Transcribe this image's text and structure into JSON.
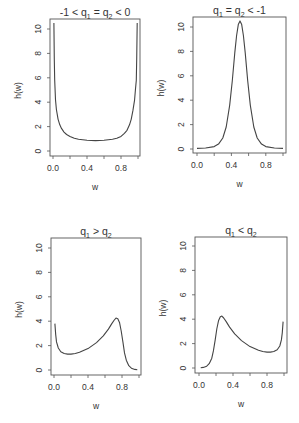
{
  "figure": {
    "line_color": "#444444",
    "axis_color": "#555555"
  },
  "chart_data": [
    {
      "type": "line",
      "title": "-1 < q1 = q2 < 0",
      "title_parts": [
        [
          "-1 < q",
          ""
        ],
        [
          "1",
          "sub"
        ],
        [
          " = q",
          ""
        ],
        [
          "2",
          "sub"
        ],
        [
          " < 0",
          ""
        ]
      ],
      "xlabel": "w",
      "ylabel": "h(w)",
      "xlim": [
        0,
        1
      ],
      "ylim": [
        0,
        10.5
      ],
      "xticks": [
        0,
        0.2,
        0.4,
        0.6,
        0.8,
        1.0
      ],
      "xtick_labels": [
        "0.0",
        "",
        "0.4",
        "",
        "0.8",
        ""
      ],
      "yticks": [
        0,
        2,
        4,
        6,
        8,
        10
      ],
      "ytick_labels": [
        "0",
        "2",
        "4",
        "6",
        "8",
        "10"
      ],
      "box": {
        "x0": 50,
        "x1": 140,
        "y0": 19,
        "y1": 156
      },
      "map": {
        "px0": 53,
        "px1": 138,
        "py0": 151,
        "py10": 29
      },
      "x": [
        0.01,
        0.015,
        0.02,
        0.03,
        0.04,
        0.06,
        0.08,
        0.1,
        0.13,
        0.16,
        0.2,
        0.25,
        0.3,
        0.4,
        0.5,
        0.6,
        0.7,
        0.75,
        0.8,
        0.84,
        0.87,
        0.9,
        0.92,
        0.94,
        0.96,
        0.97,
        0.98,
        0.985,
        0.99
      ],
      "y": [
        10.5,
        7.5,
        5.8,
        4.2,
        3.4,
        2.6,
        2.15,
        1.85,
        1.55,
        1.35,
        1.2,
        1.05,
        0.97,
        0.88,
        0.85,
        0.88,
        0.97,
        1.05,
        1.2,
        1.45,
        1.7,
        2.15,
        2.6,
        3.3,
        4.2,
        5.0,
        5.8,
        7.5,
        10.5
      ]
    },
    {
      "type": "line",
      "title": "q1 = q2 < -1",
      "title_parts": [
        [
          "q",
          ""
        ],
        [
          "1",
          "sub"
        ],
        [
          " = q",
          ""
        ],
        [
          "2",
          "sub"
        ],
        [
          " < -1",
          ""
        ]
      ],
      "xlabel": "w",
      "ylabel": "h(w)",
      "xlim": [
        0,
        1
      ],
      "ylim": [
        0,
        10.5
      ],
      "xticks": [
        0,
        0.2,
        0.4,
        0.6,
        0.8,
        1.0
      ],
      "xtick_labels": [
        "0.0",
        "",
        "0.4",
        "",
        "0.8",
        ""
      ],
      "yticks": [
        0,
        2,
        4,
        6,
        8,
        10
      ],
      "ytick_labels": [
        "0",
        "2",
        "4",
        "6",
        "8",
        "10"
      ],
      "box": {
        "x0": 193,
        "x1": 286,
        "y0": 17,
        "y1": 153
      },
      "map": {
        "px0": 197,
        "px1": 283,
        "py0": 149,
        "py10": 27
      },
      "x": [
        0.0,
        0.1,
        0.2,
        0.25,
        0.3,
        0.34,
        0.38,
        0.41,
        0.44,
        0.46,
        0.48,
        0.5,
        0.52,
        0.54,
        0.56,
        0.59,
        0.62,
        0.66,
        0.7,
        0.75,
        0.8,
        0.9,
        1.0
      ],
      "y": [
        0.05,
        0.08,
        0.2,
        0.4,
        0.9,
        1.8,
        3.6,
        5.6,
        7.9,
        9.3,
        10.2,
        10.5,
        10.2,
        9.3,
        7.9,
        5.6,
        3.6,
        1.8,
        0.9,
        0.4,
        0.2,
        0.08,
        0.05
      ]
    },
    {
      "type": "line",
      "title": "q1 > q2",
      "title_parts": [
        [
          "q",
          ""
        ],
        [
          "1",
          "sub"
        ],
        [
          " > q",
          ""
        ],
        [
          "2",
          "sub"
        ]
      ],
      "xlabel": "w",
      "ylabel": "h(w)",
      "xlim": [
        0,
        1
      ],
      "ylim": [
        0,
        10.5
      ],
      "xticks": [
        0,
        0.2,
        0.4,
        0.6,
        0.8,
        1.0
      ],
      "xtick_labels": [
        "0.0",
        "",
        "0.4",
        "",
        "0.8",
        ""
      ],
      "yticks": [
        0,
        2,
        4,
        6,
        8,
        10
      ],
      "ytick_labels": [
        "0",
        "2",
        "4",
        "6",
        "8",
        "10"
      ],
      "box": {
        "x0": 51,
        "x1": 141,
        "y0": 238,
        "y1": 375
      },
      "map": {
        "px0": 54,
        "px1": 139,
        "py0": 370,
        "py10": 248
      },
      "x": [
        0.01,
        0.02,
        0.03,
        0.05,
        0.08,
        0.12,
        0.16,
        0.2,
        0.25,
        0.3,
        0.4,
        0.5,
        0.58,
        0.64,
        0.68,
        0.71,
        0.73,
        0.75,
        0.77,
        0.79,
        0.81,
        0.83,
        0.85,
        0.88,
        0.91,
        0.95,
        0.98
      ],
      "y": [
        3.8,
        2.9,
        2.3,
        1.8,
        1.5,
        1.35,
        1.3,
        1.3,
        1.35,
        1.45,
        1.75,
        2.25,
        2.8,
        3.35,
        3.8,
        4.1,
        4.25,
        4.2,
        3.9,
        3.2,
        2.3,
        1.4,
        0.8,
        0.35,
        0.15,
        0.05,
        0.02
      ]
    },
    {
      "type": "line",
      "title": "q1 < q2",
      "title_parts": [
        [
          "q",
          ""
        ],
        [
          "1",
          "sub"
        ],
        [
          " < q",
          ""
        ],
        [
          "2",
          "sub"
        ]
      ],
      "xlabel": "w",
      "ylabel": "h(w)",
      "xlim": [
        0,
        1
      ],
      "ylim": [
        0,
        10.5
      ],
      "xticks": [
        0,
        0.2,
        0.4,
        0.6,
        0.8,
        1.0
      ],
      "xtick_labels": [
        "0.0",
        "",
        "0.4",
        "",
        "0.8",
        ""
      ],
      "yticks": [
        0,
        2,
        4,
        6,
        8,
        10
      ],
      "ytick_labels": [
        "0",
        "2",
        "4",
        "6",
        "8",
        "10"
      ],
      "box": {
        "x0": 195,
        "x1": 287,
        "y0": 237,
        "y1": 373
      },
      "map": {
        "px0": 199,
        "px1": 284,
        "py0": 368,
        "py10": 246
      },
      "x": [
        0.02,
        0.05,
        0.09,
        0.12,
        0.15,
        0.17,
        0.19,
        0.21,
        0.23,
        0.25,
        0.27,
        0.29,
        0.32,
        0.36,
        0.42,
        0.5,
        0.6,
        0.7,
        0.75,
        0.8,
        0.84,
        0.88,
        0.92,
        0.95,
        0.97,
        0.98,
        0.99
      ],
      "y": [
        0.02,
        0.05,
        0.15,
        0.35,
        0.8,
        1.4,
        2.3,
        3.2,
        3.9,
        4.2,
        4.25,
        4.1,
        3.8,
        3.35,
        2.8,
        2.25,
        1.75,
        1.45,
        1.35,
        1.3,
        1.3,
        1.35,
        1.5,
        1.8,
        2.3,
        2.9,
        3.8
      ]
    }
  ]
}
